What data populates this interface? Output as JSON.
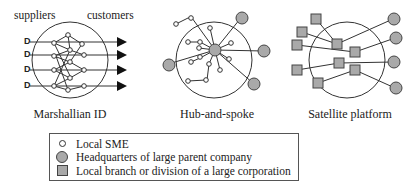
{
  "panels": {
    "marshallian": {
      "top_left_label": "suppliers",
      "top_right_label": "customers",
      "supplier_marker": "D",
      "caption": "Marshallian ID"
    },
    "hub_and_spoke": {
      "caption": "Hub-and-spoke"
    },
    "satellite": {
      "caption": "Satellite platform"
    }
  },
  "legend": {
    "items": [
      {
        "symbol": "small-open-circle-icon",
        "label": "Local SME"
      },
      {
        "symbol": "large-gray-circle-icon",
        "label": "Headquarters of large parent company"
      },
      {
        "symbol": "gray-square-icon",
        "label": "Local branch or division of a large corporation"
      }
    ]
  },
  "colors": {
    "node_fill": "#a9a9a9",
    "stroke": "#333333",
    "background": "#ffffff"
  }
}
